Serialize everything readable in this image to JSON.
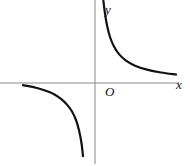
{
  "figure": {
    "background_color": "#ffffff",
    "width": 190,
    "height": 166
  },
  "labels": {
    "y_axis": "y",
    "x_axis": "x",
    "origin": "O"
  },
  "chart_data": {
    "type": "line",
    "title": "",
    "xlabel": "x",
    "ylabel": "y",
    "origin_label": "O",
    "grid": false,
    "legend": null,
    "axis_color": "#8a8a8a",
    "curve_color": "#111111",
    "curve_width": 2.2,
    "axis_width": 1,
    "xlim": [
      -4.75,
      4.75
    ],
    "ylim": [
      -4.6,
      4.6
    ],
    "function": "y = k/x, k > 0",
    "series": [
      {
        "name": "branch-quadrant-I",
        "quadrant": 1,
        "x": [
          0.42,
          0.5,
          0.6,
          0.75,
          0.95,
          1.2,
          1.55,
          2.0,
          2.6,
          3.3,
          4.05
        ],
        "y": [
          4.55,
          3.85,
          3.2,
          2.55,
          2.02,
          1.6,
          1.24,
          0.96,
          0.74,
          0.58,
          0.47
        ]
      },
      {
        "name": "branch-quadrant-III",
        "quadrant": 3,
        "x": [
          -3.6,
          -3.0,
          -2.5,
          -2.05,
          -1.7,
          -1.4,
          -1.15,
          -0.95,
          -0.8,
          -0.68,
          -0.6
        ],
        "y": [
          -0.12,
          -0.25,
          -0.42,
          -0.62,
          -0.88,
          -1.2,
          -1.58,
          -2.05,
          -2.62,
          -3.3,
          -4.05
        ]
      }
    ],
    "axes": {
      "x_axis": {
        "from": [
          -4.75,
          0
        ],
        "to": [
          4.2,
          0
        ],
        "arrow": false
      },
      "y_axis": {
        "from": [
          0,
          4.6
        ],
        "to": [
          0,
          -4.5
        ],
        "arrow": false
      }
    }
  }
}
